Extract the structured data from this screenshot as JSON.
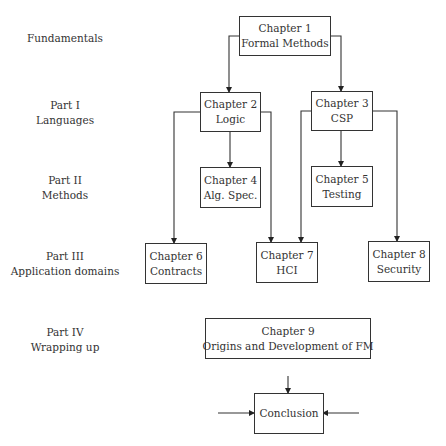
{
  "parts": [
    {
      "line1": "Fundamentals",
      "line2": ""
    },
    {
      "line1": "Part I",
      "line2": "Languages"
    },
    {
      "line1": "Part II",
      "line2": "Methods"
    },
    {
      "line1": "Part III",
      "line2": "Application domains"
    },
    {
      "line1": "Part IV",
      "line2": "Wrapping up"
    }
  ],
  "nodes": {
    "ch1": {
      "title": "Chapter 1",
      "subtitle": "Formal Methods"
    },
    "ch2": {
      "title": "Chapter 2",
      "subtitle": "Logic"
    },
    "ch3": {
      "title": "Chapter 3",
      "subtitle": "CSP"
    },
    "ch4": {
      "title": "Chapter 4",
      "subtitle": "Alg. Spec."
    },
    "ch5": {
      "title": "Chapter 5",
      "subtitle": "Testing"
    },
    "ch6": {
      "title": "Chapter 6",
      "subtitle": "Contracts"
    },
    "ch7": {
      "title": "Chapter 7",
      "subtitle": "HCI"
    },
    "ch8": {
      "title": "Chapter 8",
      "subtitle": "Security"
    },
    "ch9": {
      "title": "Chapter 9",
      "subtitle": "Origins and Development of FM"
    },
    "conclusion": {
      "title": "Conclusion"
    }
  },
  "edges": [
    {
      "from": "ch1",
      "to": "ch2"
    },
    {
      "from": "ch1",
      "to": "ch3"
    },
    {
      "from": "ch2",
      "to": "ch4"
    },
    {
      "from": "ch2",
      "to": "ch6"
    },
    {
      "from": "ch2",
      "to": "ch7"
    },
    {
      "from": "ch3",
      "to": "ch5"
    },
    {
      "from": "ch3",
      "to": "ch7"
    },
    {
      "from": "ch3",
      "to": "ch8"
    },
    {
      "from": "",
      "to": "conclusion"
    }
  ]
}
